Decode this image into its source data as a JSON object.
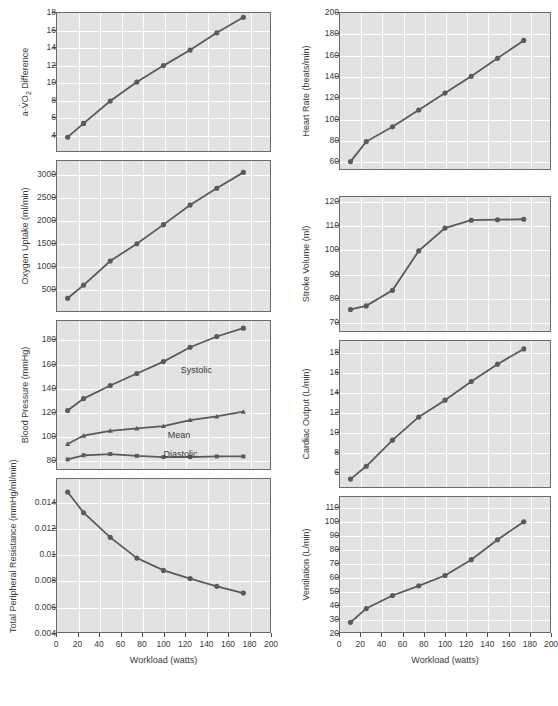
{
  "figure": {
    "background_color": "#ffffff",
    "plot_background_color": "#e2e2e2",
    "grid_color": "#ffffff",
    "series_color": "#5a5a5a",
    "axis_color": "#6b6b6b"
  },
  "shared": {
    "xlabel": "Workload (watts)",
    "xticks": [
      "0",
      "20",
      "40",
      "60",
      "80",
      "100",
      "120",
      "140",
      "160",
      "180",
      "200"
    ],
    "xlim": [
      0,
      200
    ]
  },
  "chart_data": [
    {
      "id": "avo2-difference",
      "type": "line",
      "title": "",
      "ylabel_html": "a-V̇O<sub>2</sub> Difference",
      "ylabel_plain": "a-VO2 Difference",
      "xlabel": "Workload (watts)",
      "ylim": [
        2,
        18
      ],
      "yticks": [
        "4",
        "6",
        "8",
        "10",
        "12",
        "14",
        "16",
        "18"
      ],
      "ytick_values": [
        4,
        6,
        8,
        10,
        12,
        14,
        16,
        18
      ],
      "xlim": [
        0,
        200
      ],
      "grid": true,
      "marker": "circle",
      "x": [
        10,
        25,
        50,
        75,
        100,
        125,
        150,
        175
      ],
      "values": [
        3.6,
        5.2,
        7.8,
        10.0,
        11.9,
        13.7,
        15.7,
        17.5
      ]
    },
    {
      "id": "oxygen-uptake",
      "type": "line",
      "ylabel_plain": "Oxygen Uptake (ml/min)",
      "xlabel": "Workload (watts)",
      "ylim": [
        0,
        3300
      ],
      "yticks": [
        "500",
        "1000",
        "1500",
        "2000",
        "2500",
        "3000"
      ],
      "ytick_values": [
        500,
        1000,
        1500,
        2000,
        2500,
        3000
      ],
      "xlim": [
        0,
        200
      ],
      "grid": true,
      "marker": "circle",
      "x": [
        10,
        25,
        50,
        75,
        100,
        125,
        150,
        175
      ],
      "values": [
        280,
        570,
        1100,
        1480,
        1900,
        2330,
        2700,
        3050
      ]
    },
    {
      "id": "blood-pressure",
      "type": "line",
      "ylabel_plain": "Blood Pressure (mmHg)",
      "xlabel": "Workload (watts)",
      "ylim": [
        72,
        196
      ],
      "yticks": [
        "80",
        "100",
        "120",
        "140",
        "160",
        "180"
      ],
      "ytick_values": [
        80,
        100,
        120,
        140,
        160,
        180
      ],
      "xlim": [
        0,
        200
      ],
      "grid": true,
      "x": [
        10,
        25,
        50,
        75,
        100,
        125,
        150,
        175
      ],
      "series": [
        {
          "name": "Systolic",
          "marker": "circle",
          "values": [
            121,
            131,
            142,
            152,
            162,
            174,
            183,
            190
          ],
          "annotation": "Systolic"
        },
        {
          "name": "Mean",
          "marker": "triangle",
          "values": [
            93,
            100,
            104,
            106,
            108,
            113,
            116,
            120
          ],
          "annotation": "Mean"
        },
        {
          "name": "Diastolic",
          "marker": "square",
          "values": [
            80,
            83.5,
            84.5,
            83,
            82,
            82,
            82.5,
            82.5
          ],
          "annotation": "Diastolic"
        }
      ]
    },
    {
      "id": "total-peripheral-resistance",
      "type": "line",
      "ylabel_plain": "Total Peripheral Resistance (mmHg/ml/min)",
      "xlabel": "Workload (watts)",
      "ylim": [
        0.004,
        0.0158
      ],
      "yticks": [
        "0.004",
        "0.006",
        "0.008",
        "0.01",
        "0.012",
        "0.014"
      ],
      "ytick_values": [
        0.004,
        0.006,
        0.008,
        0.01,
        0.012,
        0.014
      ],
      "xlim": [
        0,
        200
      ],
      "grid": true,
      "marker": "circle",
      "x": [
        10,
        25,
        50,
        75,
        100,
        125,
        150,
        175
      ],
      "values": [
        0.0148,
        0.0132,
        0.0113,
        0.0097,
        0.00875,
        0.00812,
        0.00752,
        0.007
      ]
    },
    {
      "id": "heart-rate",
      "type": "line",
      "ylabel_plain": "Heart Rate (beats/min)",
      "xlabel": "Workload (watts)",
      "ylim": [
        52,
        200
      ],
      "yticks": [
        "60",
        "80",
        "100",
        "120",
        "140",
        "160",
        "180",
        "200"
      ],
      "ytick_values": [
        60,
        80,
        100,
        120,
        140,
        160,
        180,
        200
      ],
      "xlim": [
        0,
        200
      ],
      "grid": true,
      "marker": "circle",
      "x": [
        10,
        25,
        50,
        75,
        100,
        125,
        150,
        175
      ],
      "values": [
        59,
        78,
        92,
        108,
        124,
        140,
        157,
        174
      ]
    },
    {
      "id": "stroke-volume",
      "type": "line",
      "ylabel_plain": "Stroke Volume (ml)",
      "xlabel": "Workload (watts)",
      "ylim": [
        66,
        122
      ],
      "yticks": [
        "70",
        "80",
        "90",
        "100",
        "110",
        "120"
      ],
      "ytick_values": [
        70,
        80,
        90,
        100,
        110,
        120
      ],
      "xlim": [
        0,
        200
      ],
      "grid": true,
      "marker": "circle",
      "x": [
        10,
        25,
        50,
        75,
        100,
        125,
        150,
        175
      ],
      "values": [
        75,
        76.5,
        83,
        99.5,
        109,
        112.3,
        112.5,
        112.7
      ]
    },
    {
      "id": "cardiac-output",
      "type": "line",
      "ylabel_plain": "Cardiac Output (L/min)",
      "xlabel": "Workload (watts)",
      "ylim": [
        4.4,
        19.2
      ],
      "yticks": [
        "6",
        "8",
        "10",
        "12",
        "14",
        "16",
        "18"
      ],
      "ytick_values": [
        6,
        8,
        10,
        12,
        14,
        16,
        18
      ],
      "xlim": [
        0,
        200
      ],
      "grid": true,
      "marker": "circle",
      "x": [
        10,
        25,
        50,
        75,
        100,
        125,
        150,
        175
      ],
      "values": [
        5.2,
        6.5,
        9.15,
        11.5,
        13.2,
        15.1,
        16.85,
        18.4
      ]
    },
    {
      "id": "ventilation",
      "type": "line",
      "ylabel_plain": "Ventilation (L/min)",
      "xlabel": "Workload (watts)",
      "ylim": [
        20,
        118
      ],
      "yticks": [
        "20",
        "30",
        "40",
        "50",
        "60",
        "70",
        "80",
        "90",
        "100",
        "110"
      ],
      "ytick_values": [
        20,
        30,
        40,
        50,
        60,
        70,
        80,
        90,
        100,
        110
      ],
      "xlim": [
        0,
        200
      ],
      "grid": true,
      "marker": "circle",
      "x": [
        10,
        25,
        50,
        75,
        100,
        125,
        150,
        175
      ],
      "values": [
        27,
        37,
        46.5,
        53.5,
        61,
        72.5,
        87,
        100,
        115
      ]
    }
  ]
}
